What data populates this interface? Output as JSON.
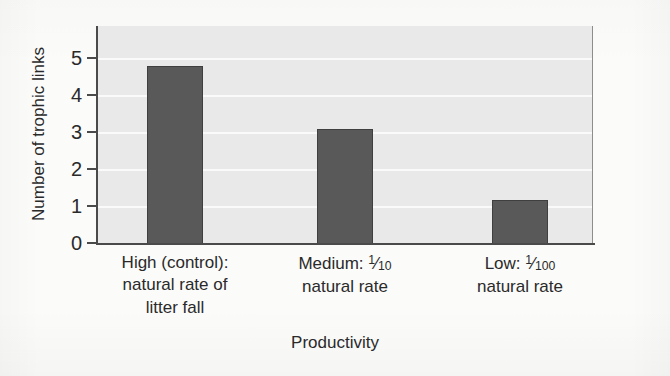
{
  "chart_data": {
    "type": "bar",
    "title": "",
    "xlabel": "Productivity",
    "ylabel": "Number of trophic links",
    "categories": [
      "High (control): natural rate of litter fall",
      "Medium: 1/10 natural rate",
      "Low: 1/100 natural rate"
    ],
    "values": [
      4.8,
      3.1,
      1.2
    ],
    "ylim": [
      0,
      5.4
    ],
    "yticks": [
      0,
      1,
      2,
      3,
      4,
      5
    ],
    "ytick_labels": [
      "0",
      "1",
      "2",
      "3",
      "4",
      "5"
    ],
    "grid": true,
    "grid_axis": "y",
    "legend": "none",
    "bar_color": "#595959",
    "plot_background": "#e9e9e9",
    "gridline_color": "#fafafa",
    "axis_color": "#4a4a4a"
  },
  "axes": {
    "y_title": "Number of trophic links",
    "x_title": "Productivity"
  },
  "y_ticks": [
    {
      "value": 0,
      "label": "0"
    },
    {
      "value": 1,
      "label": "1"
    },
    {
      "value": 2,
      "label": "2"
    },
    {
      "value": 3,
      "label": "3"
    },
    {
      "value": 4,
      "label": "4"
    },
    {
      "value": 5,
      "label": "5"
    }
  ],
  "categories": [
    {
      "key": "high",
      "lines": [
        {
          "type": "text",
          "text": "High (control):"
        },
        {
          "type": "text",
          "text": "natural rate of"
        },
        {
          "type": "text",
          "text": "litter fall"
        }
      ],
      "plain": "High (control): natural rate of litter fall",
      "value": 4.8
    },
    {
      "key": "medium",
      "lines": [
        {
          "type": "fraction",
          "prefix": "Medium: ",
          "numerator": "1",
          "denominator": "10",
          "suffix": ""
        },
        {
          "type": "text",
          "text": "natural rate"
        }
      ],
      "plain": "Medium: 1/10 natural rate",
      "value": 3.1
    },
    {
      "key": "low",
      "lines": [
        {
          "type": "fraction",
          "prefix": "Low: ",
          "numerator": "1",
          "denominator": "100",
          "suffix": ""
        },
        {
          "type": "text",
          "text": "natural rate"
        }
      ],
      "plain": "Low: 1/100 natural rate",
      "value": 1.2
    }
  ]
}
